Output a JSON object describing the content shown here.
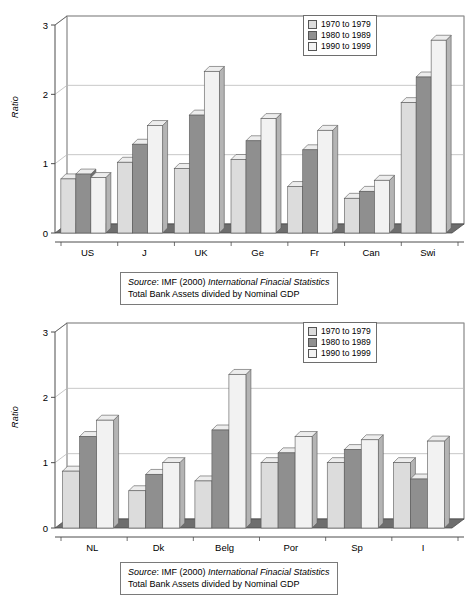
{
  "document": {
    "kind": "two-panel grouped 3D bar chart figure"
  },
  "legend": {
    "items": [
      {
        "label": "1970 to 1979",
        "color": "#dcdcdc",
        "swatch_name": "legend-swatch-1970s"
      },
      {
        "label": "1980 to 1989",
        "color": "#8f8f8f",
        "swatch_name": "legend-swatch-1980s"
      },
      {
        "label": "1990 to 1999",
        "color": "#f2f2f2",
        "swatch_name": "legend-swatch-1990s"
      }
    ]
  },
  "source_note": {
    "line1_label": "Source",
    "line1_rest": ": IMF (2000) ",
    "line1_italic": "International Finacial Statistics",
    "line2": "Total Bank Assets divided by Nominal GDP"
  },
  "axis": {
    "y_title": "Ratio",
    "y_ticks": [
      "0",
      "1",
      "2",
      "3"
    ],
    "y_min": 0,
    "y_max": 3
  },
  "chart_data": [
    {
      "id": "top-chart",
      "type": "bar",
      "title": "",
      "xlabel": "",
      "ylabel": "Ratio",
      "ylim": [
        0,
        3
      ],
      "yticks": [
        0,
        1,
        2,
        3
      ],
      "grid": true,
      "legend_position": "top-right",
      "categories": [
        "US",
        "J",
        "UK",
        "Ge",
        "Fr",
        "Can",
        "Swi"
      ],
      "series": [
        {
          "name": "1970 to 1979",
          "color": "#dcdcdc",
          "values": [
            0.78,
            1.02,
            0.93,
            1.06,
            0.67,
            0.5,
            1.88
          ]
        },
        {
          "name": "1980 to 1989",
          "color": "#8f8f8f",
          "values": [
            0.85,
            1.28,
            1.7,
            1.33,
            1.2,
            0.6,
            2.25
          ]
        },
        {
          "name": "1990 to 1999",
          "color": "#f2f2f2",
          "values": [
            0.8,
            1.55,
            2.33,
            1.65,
            1.48,
            0.76,
            2.78
          ]
        }
      ]
    },
    {
      "id": "bottom-chart",
      "type": "bar",
      "title": "",
      "xlabel": "",
      "ylabel": "Ratio",
      "ylim": [
        0,
        3
      ],
      "yticks": [
        0,
        1,
        2,
        3
      ],
      "grid": true,
      "legend_position": "top-right",
      "categories": [
        "NL",
        "Dk",
        "Belg",
        "Por",
        "Sp",
        "I"
      ],
      "series": [
        {
          "name": "1970 to 1979",
          "color": "#dcdcdc",
          "values": [
            0.87,
            0.57,
            0.72,
            1.0,
            1.0,
            1.0
          ]
        },
        {
          "name": "1980 to 1989",
          "color": "#8f8f8f",
          "values": [
            1.4,
            0.82,
            1.5,
            1.15,
            1.2,
            0.75
          ]
        },
        {
          "name": "1990 to 1999",
          "color": "#f2f2f2",
          "values": [
            1.65,
            1.0,
            2.35,
            1.4,
            1.35,
            1.33
          ]
        }
      ]
    }
  ],
  "style": {
    "bar_side_color": "#b4b4b4",
    "bar_side_color_dark": "#6f6f6f",
    "bar_top_color": "#ededed",
    "floor_color": "#6e6e6e",
    "floor_color_light": "#8a8a8a",
    "axis_color": "#4d4d4d",
    "grid_color": "#b9b9b9"
  }
}
